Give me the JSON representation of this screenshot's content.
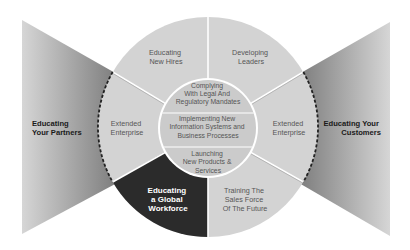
{
  "colors": {
    "background": "#ffffff",
    "sector_fill": "#d4d4d4",
    "inner_fill": "#cacaca",
    "highlight_sector": "#2b2b2b",
    "funnel_dark": "#8a8a8a",
    "funnel_light": "#d8d8d8",
    "divider": "#ffffff",
    "dashed_border": "#222222"
  },
  "diagram": {
    "outer_sectors": {
      "top_left": [
        "Educating",
        "New Hires"
      ],
      "top_right": [
        "Developing",
        "Leaders"
      ],
      "left": [
        "Extended",
        "Enterprise"
      ],
      "right": [
        "Extended",
        "Enterprise"
      ],
      "bottom_left": [
        "Educating",
        "a Global",
        "Workforce"
      ],
      "bottom_right": [
        "Training The",
        "Sales Force",
        "Of The Future"
      ]
    },
    "inner_bands": {
      "top": [
        "Complying",
        "With Legal And",
        "Regulatory Mandates"
      ],
      "middle": [
        "Implementing New",
        "Information Systems and",
        "Business Processes"
      ],
      "bottom": [
        "Launching",
        "New Products &",
        "Services"
      ]
    },
    "left_funnel": [
      "Educating",
      "Your Partners"
    ],
    "right_funnel": [
      "Educating Your",
      "Customers"
    ]
  }
}
